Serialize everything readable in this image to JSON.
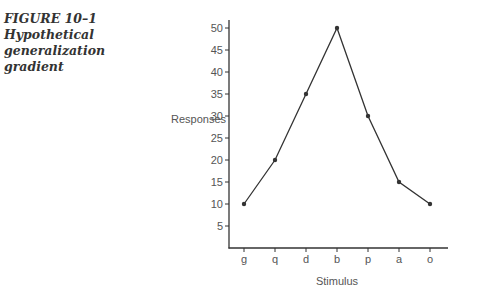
{
  "caption": {
    "figure_label": "FIGURE 10–1",
    "line1": "Hypothetical",
    "line2": "generalization",
    "line3": "gradient"
  },
  "chart_data": {
    "type": "line",
    "title": "Hypothetical generalization gradient",
    "xlabel": "Stimulus",
    "ylabel": "Responses",
    "categories": [
      "g",
      "q",
      "d",
      "b",
      "p",
      "a",
      "o"
    ],
    "values": [
      10,
      20,
      35,
      50,
      30,
      15,
      10
    ],
    "yticks": [
      5,
      10,
      15,
      20,
      25,
      30,
      35,
      40,
      45,
      50
    ],
    "ylim": [
      0,
      52
    ],
    "grid": false,
    "legend": null,
    "markers": true
  },
  "colors": {
    "line": "#333333",
    "axis": "#333333",
    "text": "#555555"
  }
}
